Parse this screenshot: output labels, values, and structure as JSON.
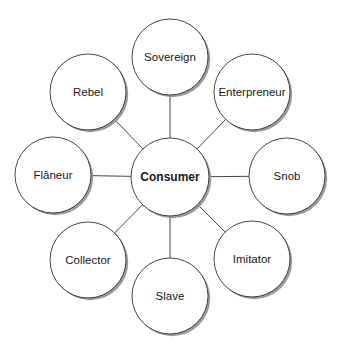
{
  "diagram": {
    "type": "hub-and-spoke",
    "center": {
      "label": "Consumer",
      "x": 170,
      "y": 177,
      "r": 39
    },
    "nodes": [
      {
        "label": "Sovereign",
        "x": 170,
        "y": 57,
        "r": 38
      },
      {
        "label": "Enterpreneur",
        "x": 252,
        "y": 92,
        "r": 38
      },
      {
        "label": "Snob",
        "x": 287,
        "y": 176,
        "r": 38
      },
      {
        "label": "Imitator",
        "x": 252,
        "y": 259,
        "r": 38
      },
      {
        "label": "Slave",
        "x": 170,
        "y": 296,
        "r": 38
      },
      {
        "label": "Collector",
        "x": 88,
        "y": 260,
        "r": 38
      },
      {
        "label": "Flâneur",
        "x": 53,
        "y": 175,
        "r": 38
      },
      {
        "label": "Rebel",
        "x": 88,
        "y": 92,
        "r": 38
      }
    ],
    "colors": {
      "stroke": "#333333",
      "fill": "#ffffff",
      "shadow": "#9a9a9a",
      "text": "#1a1a1a"
    }
  }
}
